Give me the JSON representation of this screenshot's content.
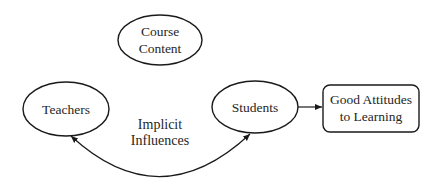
{
  "diagram": {
    "nodes": [
      {
        "id": "course-content",
        "shape": "ellipse",
        "lines": [
          "Course",
          "Content"
        ]
      },
      {
        "id": "teachers",
        "shape": "ellipse",
        "lines": [
          "Teachers"
        ]
      },
      {
        "id": "students",
        "shape": "ellipse",
        "lines": [
          "Students"
        ]
      },
      {
        "id": "good-attitudes",
        "shape": "rounded-rectangle",
        "lines": [
          "Good Attitudes",
          "to Learning"
        ]
      }
    ],
    "edges": [
      {
        "from": "students",
        "to": "good-attitudes",
        "type": "arrow"
      },
      {
        "from": "teachers",
        "to": "students",
        "type": "curved-double-arrow",
        "label_lines": [
          "Implicit",
          "Influences"
        ]
      }
    ],
    "colors": {
      "stroke": "#1a1a1a",
      "text": "#262626",
      "background": "#ffffff"
    }
  }
}
